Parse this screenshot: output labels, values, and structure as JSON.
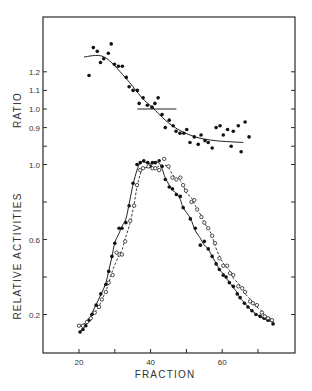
{
  "chart_data": [
    {
      "type": "scatter",
      "panel": "top",
      "title": "",
      "xlabel": "FRACTION",
      "ylabel": "RATIO",
      "xlim": [
        10,
        80
      ],
      "ylim": [
        0.7,
        1.5
      ],
      "yticks": [
        0.8,
        0.9,
        1.0,
        1.1,
        1.2
      ],
      "ytick_labels": [
        "",
        "0.9",
        "1.0",
        "1.1",
        "1.2"
      ],
      "grid": false,
      "series": [
        {
          "name": "ratio",
          "marker": "filled-circle",
          "x": [
            22.8,
            24.0,
            25.1,
            26.0,
            26.9,
            28.2,
            29.0,
            29.9,
            31.0,
            32.1,
            33.2,
            34.0,
            35.1,
            36.3,
            36.8,
            37.9,
            39.1,
            40.4,
            41.2,
            42.1,
            43.2,
            44.1,
            45.2,
            46.3,
            47.1,
            48.2,
            49.3,
            50.1,
            51.0,
            52.2,
            53.3,
            54.1,
            55.2,
            56.1,
            57.2,
            58.3,
            59.4,
            60.3,
            61.5,
            62.5,
            63.1,
            64.5,
            65.3,
            66.4,
            67.5
          ],
          "y": [
            1.18,
            1.33,
            1.31,
            1.25,
            1.27,
            1.3,
            1.35,
            1.24,
            1.23,
            1.23,
            1.17,
            1.12,
            1.1,
            1.1,
            1.03,
            1.06,
            1.02,
            1.01,
            1.03,
            1.06,
            0.97,
            0.9,
            0.94,
            0.91,
            0.88,
            0.87,
            0.87,
            0.89,
            0.82,
            0.85,
            0.81,
            0.86,
            0.83,
            0.82,
            0.79,
            0.9,
            0.91,
            0.86,
            0.89,
            0.8,
            0.88,
            0.91,
            0.77,
            0.93,
            0.85
          ]
        },
        {
          "name": "ratio-fit",
          "style": "solid-line",
          "x": [
            21.4,
            27.0,
            32.9,
            37.6,
            40.4,
            44.1,
            47.7,
            52.5,
            58.0,
            65.9
          ],
          "y": [
            1.28,
            1.28,
            1.17,
            1.06,
            1.01,
            0.94,
            0.89,
            0.85,
            0.83,
            0.82
          ]
        },
        {
          "name": "reference-line",
          "style": "solid-line",
          "x": [
            36.3,
            47.2
          ],
          "y": [
            1.0,
            1.0
          ]
        }
      ]
    },
    {
      "type": "line",
      "panel": "bottom",
      "title": "",
      "xlabel": "FRACTION",
      "ylabel": "RELATIVE ACTIVITIES",
      "xlim": [
        10,
        80
      ],
      "ylim": [
        0,
        1.0
      ],
      "xticks": [
        20,
        30,
        40,
        50,
        60,
        70
      ],
      "xtick_labels": [
        "20",
        "",
        "40",
        "",
        "60",
        ""
      ],
      "yticks": [
        0.2,
        0.4,
        0.6,
        0.8,
        1.0
      ],
      "ytick_labels": [
        "0.2",
        "",
        "0.6",
        "",
        "1.0"
      ],
      "grid": false,
      "series": [
        {
          "name": "activity-A",
          "marker": "filled-circle",
          "line": "solid",
          "x": [
            20.3,
            21.1,
            21.9,
            22.8,
            23.6,
            24.8,
            26.1,
            27.5,
            28.3,
            29.2,
            30.0,
            31.2,
            32.0,
            33.1,
            34.0,
            35.1,
            36.2,
            37.1,
            38.1,
            39.2,
            39.9,
            40.5,
            41.3,
            42.4,
            43.2,
            44.1,
            45.2,
            46.1,
            47.2,
            48.3,
            49.1,
            51.1,
            52.5,
            53.9,
            55.0,
            56.1,
            57.2,
            58.3,
            59.2,
            60.3,
            61.1,
            62.0,
            63.1,
            64.2,
            65.0,
            66.2,
            67.2,
            68.3,
            69.4,
            70.6,
            71.7,
            72.8,
            74.2
          ],
          "y": [
            0.107,
            0.12,
            0.14,
            0.17,
            0.2,
            0.25,
            0.31,
            0.36,
            0.43,
            0.51,
            0.58,
            0.66,
            0.66,
            0.69,
            0.78,
            0.9,
            1.0,
            1.01,
            1.02,
            1.01,
            0.99,
            1.01,
            1.01,
            1.02,
            0.99,
            0.92,
            0.88,
            0.87,
            0.84,
            0.83,
            0.77,
            0.71,
            0.66,
            0.57,
            0.59,
            0.55,
            0.51,
            0.47,
            0.44,
            0.41,
            0.4,
            0.37,
            0.35,
            0.31,
            0.29,
            0.26,
            0.24,
            0.22,
            0.2,
            0.19,
            0.18,
            0.17,
            0.15
          ]
        },
        {
          "name": "activity-B",
          "marker": "open-circle",
          "line": "dashed",
          "x": [
            20.0,
            21.1,
            22.2,
            23.3,
            24.4,
            25.6,
            26.4,
            27.5,
            28.3,
            29.4,
            30.5,
            31.3,
            32.0,
            32.9,
            34.3,
            35.4,
            36.2,
            37.1,
            37.9,
            39.4,
            40.5,
            41.3,
            42.4,
            43.8,
            45.0,
            46.1,
            47.2,
            48.3,
            49.1,
            49.9,
            51.4,
            52.2,
            53.0,
            54.2,
            55.0,
            56.1,
            57.2,
            58.0,
            59.2,
            60.3,
            61.4,
            62.2,
            63.1,
            64.5,
            65.6,
            66.4,
            67.8,
            68.6,
            69.7,
            71.1,
            71.9,
            72.8,
            73.9
          ],
          "y": [
            0.14,
            0.14,
            0.16,
            0.18,
            0.21,
            0.24,
            0.28,
            0.32,
            0.37,
            0.41,
            0.53,
            0.52,
            0.52,
            0.59,
            0.7,
            0.78,
            0.89,
            0.97,
            0.98,
            0.99,
            0.98,
            0.98,
            0.97,
            1.03,
            0.99,
            0.93,
            0.92,
            0.93,
            0.89,
            0.86,
            0.8,
            0.81,
            0.76,
            0.72,
            0.69,
            0.66,
            0.62,
            0.58,
            0.5,
            0.46,
            0.46,
            0.42,
            0.41,
            0.35,
            0.34,
            0.32,
            0.27,
            0.26,
            0.25,
            0.21,
            0.19,
            0.18,
            0.17
          ]
        }
      ]
    }
  ]
}
